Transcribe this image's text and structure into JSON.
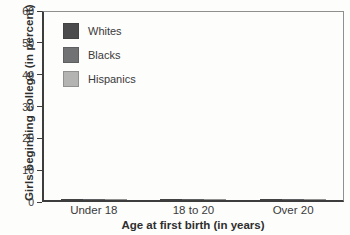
{
  "chart_data": {
    "type": "bar",
    "title": "",
    "xlabel": "Age at first birth (in years)",
    "ylabel": "Girls beginning college (in percent)",
    "ylim": [
      0,
      60
    ],
    "yticks": [
      0,
      10,
      20,
      30,
      40,
      50,
      60
    ],
    "grid": false,
    "legend_position": "upper-left-inside",
    "categories": [
      "Under 18",
      "18 to 20",
      "Over 20"
    ],
    "series": [
      {
        "name": "Whites",
        "color": "#4b4b4d",
        "values": [
          6,
          10,
          51
        ]
      },
      {
        "name": "Blacks",
        "color": "#717274",
        "values": [
          14,
          19,
          53
        ]
      },
      {
        "name": "Hispanics",
        "color": "#b4b5b3",
        "values": [
          9,
          12,
          42
        ]
      }
    ],
    "colors": {
      "axis": "#3d3d3d",
      "frame": "#8f8f8f",
      "text": "#3a3a3a",
      "background": "#fdfdfc"
    }
  }
}
